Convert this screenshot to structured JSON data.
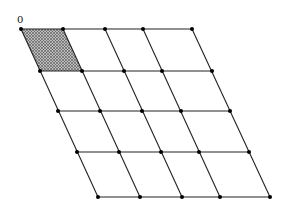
{
  "diagram": {
    "type": "parallelogram lattice",
    "origin_label": "0",
    "rows": [
      {
        "y": 29,
        "x": [
          21,
          63,
          105,
          143,
          192
        ]
      },
      {
        "y": 71,
        "x": [
          40,
          82,
          124,
          162,
          212
        ]
      },
      {
        "y": 111,
        "x": [
          58,
          100,
          142,
          181,
          230
        ]
      },
      {
        "y": 152,
        "x": [
          77,
          119,
          161,
          199,
          249
        ]
      },
      {
        "y": 197,
        "x": [
          98,
          140,
          182,
          220,
          270
        ]
      }
    ],
    "shaded_cell": {
      "row": 0,
      "col": 0
    },
    "colors": {
      "line": "#222222",
      "point": "#000000",
      "hatch": "#555555"
    }
  }
}
